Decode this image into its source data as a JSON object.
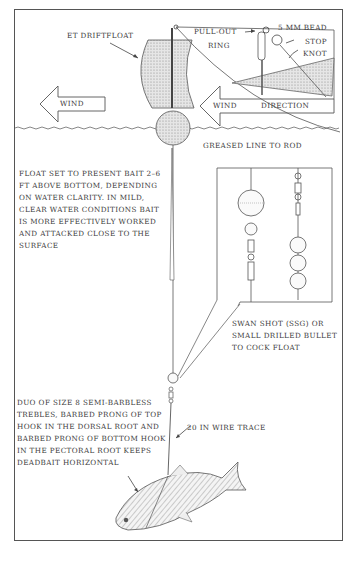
{
  "labels": {
    "driftfloat": "ET DRIFTFLOAT",
    "pull_out_ring_line1": "PULL-OUT",
    "pull_out_ring_line2": "RING",
    "bead": "5 MM BEAD",
    "stop_knot_line1": "STOP",
    "stop_knot_line2": "KNOT",
    "wind_left": "WIND",
    "wind_direction_word": "WIND",
    "wind_direction_dir": "DIRECTION",
    "greased_line": "GREASED LINE TO ROD",
    "float_setting": "FLOAT SET TO PRESENT BAIT 2–6 FT ABOVE BOTTOM, DEPENDING ON WATER CLARITY. IN MILD, CLEAR WATER CONDITIONS BAIT IS MORE EFFECTIVELY WORKED AND ATTACKED CLOSE TO THE SURFACE",
    "swan_shot": "SWAN SHOT (SSG) OR SMALL DRILLED BULLET TO COCK FLOAT",
    "wire_trace": "20 IN WIRE TRACE",
    "trebles": "DUO OF SIZE 8 SEMI-BARBLESS TREBLES, BARBED PRONG OF TOP HOOK IN THE DORSAL ROOT AND BARBED PRONG OF BOTTOM HOOK IN THE PECTORAL ROOT KEEPS DEADBAIT HORIZONTAL"
  },
  "colors": {
    "ink": "#3b3b3b",
    "shade": "#d8d8d8",
    "frame": "#555555"
  }
}
